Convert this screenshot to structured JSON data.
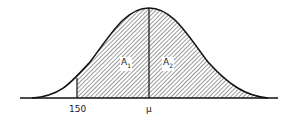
{
  "diagram": {
    "type": "normal-distribution-curve",
    "regions": [
      {
        "label": "A",
        "subscript": "1",
        "description": "shaded area between 150 and mean"
      },
      {
        "label": "A",
        "subscript": "2",
        "description": "shaded area right of mean"
      }
    ],
    "x_ticks": [
      {
        "label": "150"
      },
      {
        "label": "μ"
      }
    ],
    "colors": {
      "line": "#111111",
      "hatch": "#555555",
      "background": "#ffffff"
    }
  }
}
